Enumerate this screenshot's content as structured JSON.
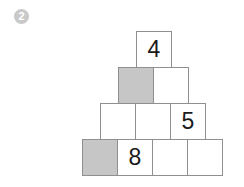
{
  "question": {
    "number": "2"
  },
  "puzzle": {
    "type": "number-pyramid",
    "rows": [
      {
        "row_index": 1,
        "bricks": [
          {
            "value": "4",
            "shaded": false
          }
        ]
      },
      {
        "row_index": 2,
        "bricks": [
          {
            "value": "",
            "shaded": true
          },
          {
            "value": "",
            "shaded": false
          }
        ]
      },
      {
        "row_index": 3,
        "bricks": [
          {
            "value": "",
            "shaded": false
          },
          {
            "value": "",
            "shaded": false
          },
          {
            "value": "5",
            "shaded": false
          }
        ]
      },
      {
        "row_index": 4,
        "bricks": [
          {
            "value": "",
            "shaded": true
          },
          {
            "value": "8",
            "shaded": false
          },
          {
            "value": "",
            "shaded": false
          },
          {
            "value": "",
            "shaded": false
          }
        ]
      }
    ],
    "colors": {
      "brick_fill": "#ffffff",
      "brick_shaded_fill": "#c6c6c6",
      "brick_border": "#8f8f8f",
      "digit": "#1a1a1a",
      "badge_fill": "#c9c9c9",
      "badge_text": "#ffffff",
      "background": "#ffffff"
    }
  }
}
